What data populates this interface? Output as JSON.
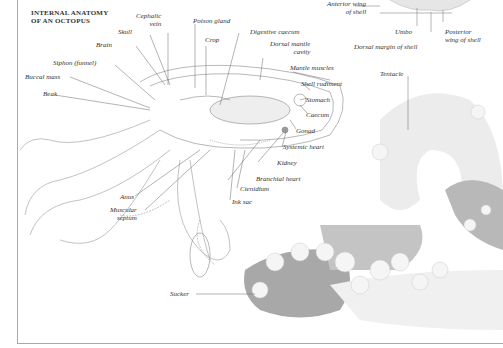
{
  "title": {
    "line1": "INTERNAL ANATOMY",
    "line2": "OF AN OCTOPUS"
  },
  "labels": {
    "cephalic_vein_1": "Cephalic",
    "cephalic_vein_2": "vein",
    "skull": "Skull",
    "poison_gland": "Poison gland",
    "crop": "Crop",
    "digestive_caecum": "Digestive caecum",
    "brain": "Brain",
    "dorsal_mantle_cavity_1": "Dorsal mantle",
    "dorsal_mantle_cavity_2": "cavity",
    "siphon": "Siphon (funnel)",
    "mantle_muscles": "Mantle muscles",
    "buccal_mass": "Buccal mass",
    "shell_rudiment": "Shell rudiment",
    "beak": "Beak",
    "stomach": "Stomach",
    "caecum": "Caecum",
    "gonad": "Gonad",
    "systemic_heart": "Systemic heart",
    "kidney": "Kidney",
    "branchial_heart": "Branchial heart",
    "anus": "Anus",
    "ctenidium": "Ctenidium",
    "ink_sac": "Ink sac",
    "muscular_septum_1": "Muscular",
    "muscular_septum_2": "septum",
    "sucker": "Sucker",
    "tentacle": "Tentacle",
    "anterior_wing_1": "Anterior wing",
    "anterior_wing_2": "of shell",
    "umbo": "Umbo",
    "posterior_wing_1": "Posterior",
    "posterior_wing_2": "wing of shell",
    "dorsal_margin": "Dorsal margin of shell"
  },
  "colors": {
    "line": "#777777",
    "text": "#333333",
    "shade": "#9a9a9a"
  }
}
